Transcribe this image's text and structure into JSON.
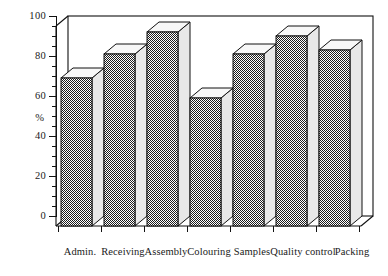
{
  "chart_data": {
    "type": "bar",
    "title": "",
    "subtitle": "",
    "xlabel": "",
    "ylabel": "%",
    "categories": [
      "Admin.",
      "Receiving",
      "Assembly",
      "Colouring",
      "Samples",
      "Quality control",
      "Packing"
    ],
    "values": [
      74,
      86,
      97,
      64,
      86,
      95,
      88
    ],
    "ylim": [
      0,
      100
    ],
    "ytick_labels": [
      "0",
      "20",
      "40",
      "60",
      "80",
      "100"
    ],
    "ytick_values": [
      0,
      20,
      40,
      60,
      80,
      100
    ],
    "yminor_step": 5,
    "grid": false,
    "legend": null,
    "style": {
      "bar_fill": "#808080",
      "bar_outline": "#111111",
      "bar_side_face": "#e8e8e8",
      "bar_top_face": "#f7f7f7",
      "axis_color": "#111111",
      "background": "#ffffff",
      "three_d": true
    }
  },
  "axis": {
    "unit_label": "%"
  }
}
